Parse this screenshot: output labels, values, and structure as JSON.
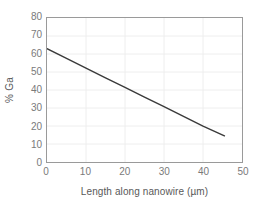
{
  "chart_data": {
    "type": "line",
    "title": "",
    "xlabel": "Length along nanowire (µm)",
    "ylabel": "% Ga",
    "xlim": [
      0,
      50
    ],
    "ylim": [
      0,
      80
    ],
    "xticks": [
      0,
      10,
      20,
      30,
      40,
      50
    ],
    "yticks": [
      0,
      10,
      20,
      30,
      40,
      50,
      60,
      70,
      80
    ],
    "xtick_labels": [
      "0",
      "10",
      "20",
      "30",
      "40",
      "50"
    ],
    "ytick_labels": [
      "0",
      "10",
      "20",
      "30",
      "40",
      "50",
      "60",
      "70",
      "80"
    ],
    "grid": true,
    "grid_color": "#eeeeee",
    "legend": false,
    "legend_position": "none",
    "series": [
      {
        "name": "% Ga along nanowire",
        "color": "#3a3a3a",
        "line_width": 1.4,
        "marker": "none",
        "x": [
          0,
          5,
          10,
          15,
          20,
          25,
          30,
          35,
          40,
          45.5
        ],
        "values": [
          63,
          57.6,
          52.2,
          46.8,
          41.5,
          36.1,
          30.7,
          25.3,
          19.9,
          14.5
        ]
      }
    ],
    "axis_color": "#9a9a9a",
    "tick_label_color": "#7a7a7a",
    "axis_title_color": "#595959",
    "background": "#ffffff"
  }
}
